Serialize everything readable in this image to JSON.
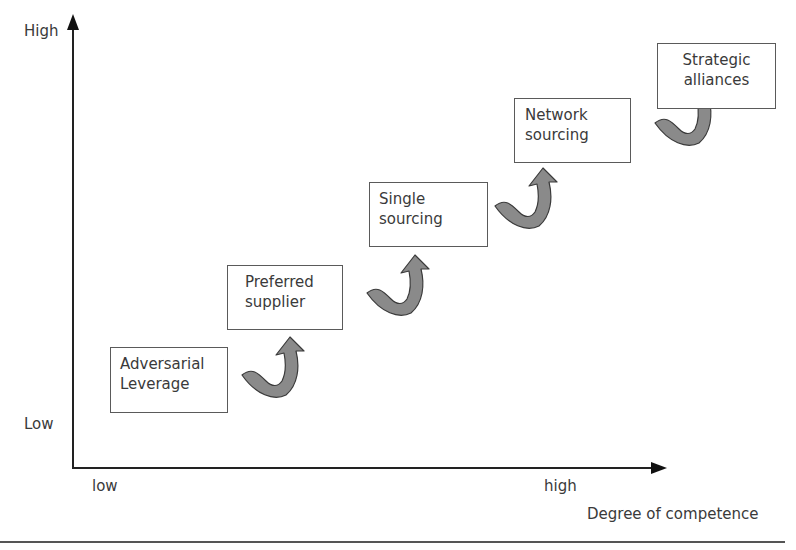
{
  "axes": {
    "y_high": "High",
    "y_low": "Low",
    "x_low": "low",
    "x_high": "high",
    "x_title": "Degree of competence"
  },
  "stages": [
    {
      "label": "Adversarial\nLeverage"
    },
    {
      "label": "Preferred\nsupplier"
    },
    {
      "label": "Single\nsourcing"
    },
    {
      "label": "Network\nsourcing"
    },
    {
      "label": "Strategic\nalliances"
    }
  ],
  "colors": {
    "arrow_fill": "#8a8a8a",
    "arrow_stroke": "#3a3a3a",
    "axis": "#222222"
  }
}
